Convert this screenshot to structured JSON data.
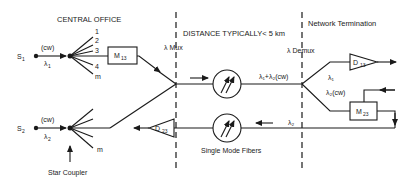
{
  "sections": {
    "central_office": "CENTRAL OFFICE",
    "distance": "DISTANCE TYPICALLY< 5 km",
    "network_termination": "Network Termination"
  },
  "multiplexers": {
    "mux": "λ Mux",
    "demux": "λ Demux"
  },
  "sources": [
    {
      "label": "S",
      "sub": "1",
      "mode": "(cw)",
      "wavelength": "λ",
      "wavelength_sub": "1"
    },
    {
      "label": "S",
      "sub": "2",
      "mode": "(cw)",
      "wavelength": "λ",
      "wavelength_sub": "2"
    }
  ],
  "coupler_ports": [
    "1",
    "2",
    "3",
    "4",
    "m"
  ],
  "coupler_ports_lower": [
    "m"
  ],
  "star_coupler_label": "Star Coupler",
  "modulators": [
    {
      "label": "M",
      "sub": "13"
    },
    {
      "label": "M",
      "sub": "23"
    }
  ],
  "detectors": [
    {
      "label": "D",
      "sub": "13"
    },
    {
      "label": "D",
      "sub": "23"
    }
  ],
  "fiber_labels": {
    "combined": "λ₁+λ₂(cw)",
    "branch_top": "λ₁",
    "branch_bottom": "λ₂(cw)",
    "return": "λ₂",
    "fibers": "Single Mode Fibers"
  },
  "colors": {
    "ink": "#1a1a1a",
    "background": "#ffffff"
  }
}
